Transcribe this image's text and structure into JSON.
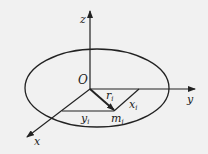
{
  "diagram": {
    "type": "3d-coordinate-system",
    "colors": {
      "line": "#222222",
      "background": "#f1f1f1"
    },
    "labels": {
      "z_axis": "z",
      "y_axis": "y",
      "x_axis": "x",
      "origin": "O",
      "r_main": "r",
      "r_sub": "i",
      "x_main": "x",
      "x_sub": "i",
      "y_main": "y",
      "y_sub": "i",
      "m_main": "m",
      "m_sub": "i"
    },
    "elements": [
      "ellipse-body",
      "z-axis",
      "y-axis",
      "x-axis",
      "position-vector-r_i",
      "projection-x_i",
      "projection-y_i",
      "point-m_i"
    ]
  }
}
